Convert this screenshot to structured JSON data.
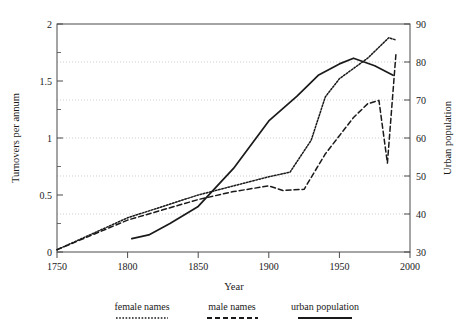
{
  "chart_data": {
    "type": "line",
    "title": "",
    "xlabel": "Year",
    "ylabel": "Turnovers per annum",
    "y2label": "Urban population",
    "xlim": [
      1750,
      2000
    ],
    "ylim": [
      0,
      2
    ],
    "y2lim": [
      30,
      90
    ],
    "xticks": [
      "1750",
      "1800",
      "1850",
      "1900",
      "1950",
      "2000"
    ],
    "yticks": [
      "0",
      "0.5",
      "1",
      "1.5",
      "2"
    ],
    "y2ticks": [
      "30",
      "40",
      "50",
      "60",
      "70",
      "80",
      "90"
    ],
    "grid": "horizontal dotted gridlines aligned to right axis ticks 40,50,60,70,80",
    "legend_position": "below plot",
    "series": [
      {
        "name": "female names",
        "style": "dotted",
        "axis": "left",
        "x": [
          1750,
          1800,
          1825,
          1850,
          1875,
          1900,
          1915,
          1930,
          1940,
          1950,
          1960,
          1970,
          1980,
          1985,
          1990
        ],
        "values": [
          0.02,
          0.3,
          0.4,
          0.5,
          0.58,
          0.66,
          0.7,
          0.98,
          1.36,
          1.52,
          1.61,
          1.7,
          1.82,
          1.88,
          1.86
        ]
      },
      {
        "name": "male names",
        "style": "dashed",
        "axis": "left",
        "x": [
          1750,
          1800,
          1825,
          1850,
          1875,
          1900,
          1910,
          1925,
          1940,
          1950,
          1960,
          1970,
          1978,
          1984,
          1990
        ],
        "values": [
          0.02,
          0.28,
          0.37,
          0.46,
          0.53,
          0.58,
          0.54,
          0.55,
          0.86,
          1.02,
          1.18,
          1.3,
          1.33,
          0.78,
          1.73
        ]
      },
      {
        "name": "urban population",
        "style": "solid",
        "axis": "right",
        "x": [
          1803,
          1815,
          1830,
          1850,
          1875,
          1900,
          1920,
          1935,
          1950,
          1960,
          1975,
          1988
        ],
        "values": [
          33.5,
          34.5,
          37.5,
          42.0,
          52.0,
          64.5,
          71.0,
          76.5,
          79.5,
          81.0,
          79.0,
          76.5
        ]
      }
    ]
  },
  "legend": {
    "items": [
      {
        "label": "female names",
        "style": "dotted"
      },
      {
        "label": "male names",
        "style": "dashed"
      },
      {
        "label": "urban population",
        "style": "solid"
      }
    ]
  }
}
